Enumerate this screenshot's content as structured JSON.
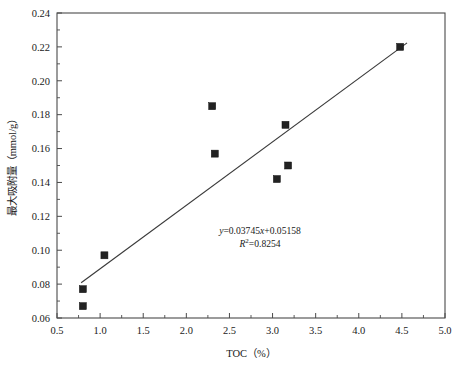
{
  "chart_data": {
    "type": "scatter",
    "title": "",
    "xlabel": "TOC（%）",
    "ylabel": "最大吸附量（mmol/g）",
    "xlim": [
      0.5,
      5.0
    ],
    "ylim": [
      0.06,
      0.24
    ],
    "xticks": [
      "0.5",
      "1.0",
      "1.5",
      "2.0",
      "2.5",
      "3.0",
      "3.5",
      "4.0",
      "4.5",
      "5.0"
    ],
    "xtick_values": [
      0.5,
      1.0,
      1.5,
      2.0,
      2.5,
      3.0,
      3.5,
      4.0,
      4.5,
      5.0
    ],
    "yticks": [
      "0.06",
      "0.08",
      "0.10",
      "0.12",
      "0.14",
      "0.16",
      "0.18",
      "0.20",
      "0.22",
      "0.24"
    ],
    "ytick_values": [
      0.06,
      0.08,
      0.1,
      0.12,
      0.14,
      0.16,
      0.18,
      0.2,
      0.22,
      0.24
    ],
    "grid": false,
    "legend": "none",
    "minor_ticks": true,
    "points": [
      {
        "x": 0.8,
        "y": 0.077
      },
      {
        "x": 0.8,
        "y": 0.067
      },
      {
        "x": 1.05,
        "y": 0.097
      },
      {
        "x": 2.3,
        "y": 0.185
      },
      {
        "x": 2.33,
        "y": 0.157
      },
      {
        "x": 3.05,
        "y": 0.142
      },
      {
        "x": 3.15,
        "y": 0.174
      },
      {
        "x": 3.18,
        "y": 0.15
      },
      {
        "x": 4.48,
        "y": 0.22
      }
    ],
    "marker": {
      "shape": "square",
      "color": "#222222",
      "size": 7
    },
    "trendline": {
      "type": "linear",
      "slope": 0.03745,
      "intercept": 0.05158,
      "r_squared": 0.8254,
      "x_start": 0.78,
      "x_end": 4.56,
      "color": "#3a3a3a"
    },
    "annotations": {
      "equation": "y=0.03745x+0.05158",
      "equation_parts": {
        "y": "y",
        "body": "=0.03745",
        "x": "x",
        "tail": "+0.05158"
      },
      "r2_parts": {
        "r": "R",
        "sup": "2",
        "value": "=0.8254"
      },
      "r_squared_label": "R²=0.8254"
    }
  }
}
